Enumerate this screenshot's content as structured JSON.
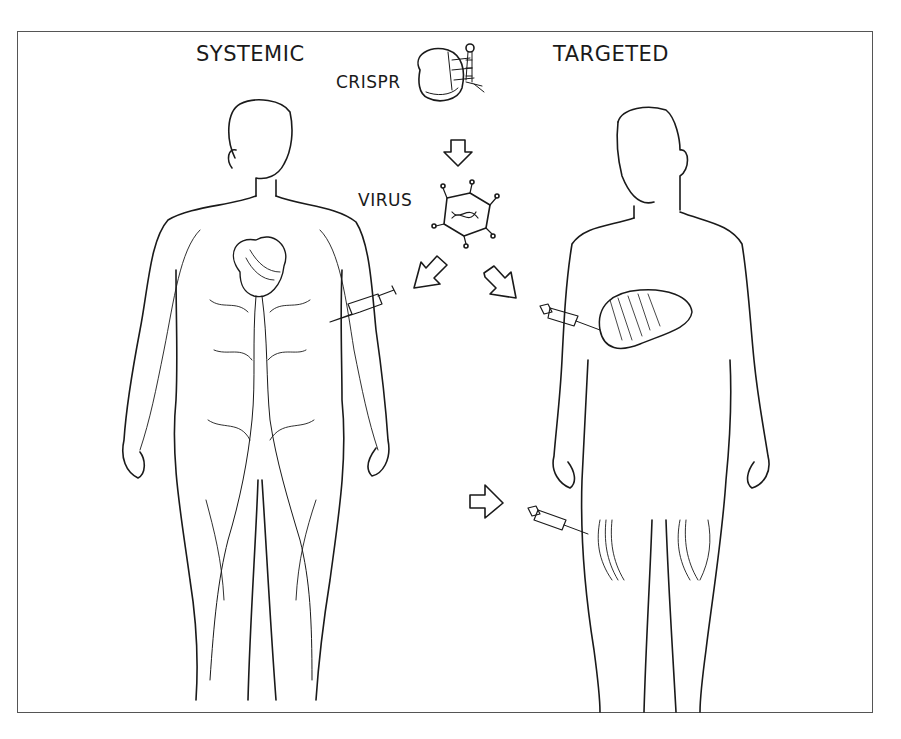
{
  "figure": {
    "left_title": "SYSTEMIC",
    "right_title": "TARGETED",
    "components": [
      {
        "label": "CRISPR",
        "icon": "cas9-protein-with-guide-rna-icon"
      },
      {
        "label": "VIRUS",
        "icon": "viral-capsid-with-dna-icon"
      }
    ],
    "flow": [
      {
        "from": "CRISPR",
        "to": "VIRUS",
        "arrow": "down"
      },
      {
        "from": "VIRUS",
        "to": "SYSTEMIC",
        "arrow": "down-left"
      },
      {
        "from": "VIRUS",
        "to": "TARGETED",
        "arrow": "down-right"
      }
    ],
    "systemic_figure": {
      "description": "human body with circulatory system (heart and blood vessels)",
      "injection_site": "arm (intravenous)"
    },
    "targeted_figure": {
      "description": "human body outline",
      "injection_sites": [
        "liver",
        "thigh muscle"
      ]
    },
    "colors": {
      "ink": "#1a1a1a",
      "background": "#ffffff",
      "frame": "#555555"
    }
  }
}
